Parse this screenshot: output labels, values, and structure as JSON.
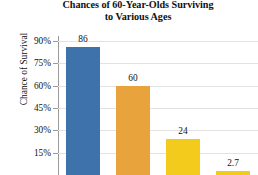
{
  "chart_data": {
    "type": "bar",
    "title": "Chances of 60-Year-Olds Surviving to Various Ages",
    "title_lines": [
      "Chances of 60-Year-Olds Surviving",
      "to Various Ages"
    ],
    "categories": [
      "",
      "",
      "",
      ""
    ],
    "values": [
      86,
      60,
      24,
      2.7
    ],
    "data_labels": [
      "86",
      "60",
      "24",
      "2.7"
    ],
    "xlabel": "",
    "ylabel": "Chance of Survival",
    "ylim": [
      0,
      97.5
    ],
    "yticks": [
      90,
      75,
      60,
      45,
      30,
      15
    ],
    "ytick_labels": [
      "90%",
      "75%",
      "60%",
      "45%",
      "30%",
      "15%"
    ],
    "grid": true,
    "legend": "none",
    "bar_colors": [
      "#3d72ab",
      "#e8a33d",
      "#f2cb1d",
      "#f2cb1d"
    ],
    "gridline_color": "#e2e2e2",
    "axis_color": "#9a9a9a",
    "note": "bottom of figure is cropped; category axis labels not visible"
  }
}
